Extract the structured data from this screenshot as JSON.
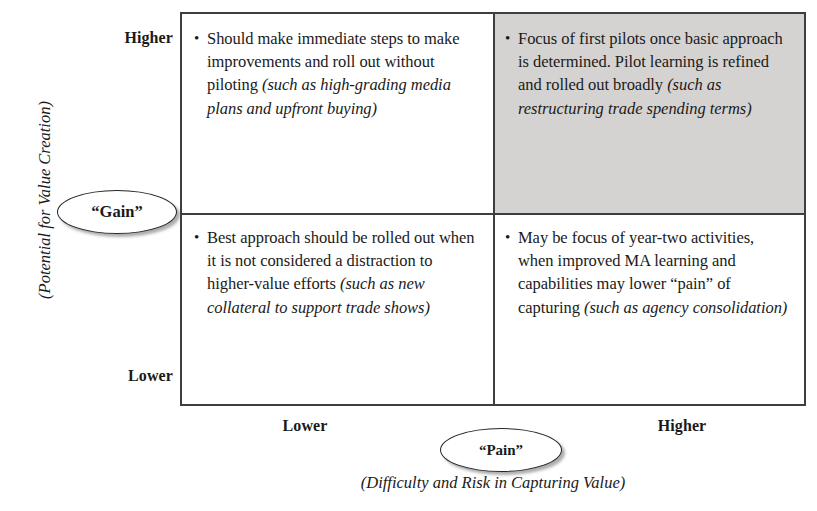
{
  "matrix": {
    "quadrants": [
      {
        "id": "top-left",
        "position": "high-gain-low-pain",
        "shaded": false,
        "bullet": "•",
        "text_plain": "Should make immediate steps to make improvements and roll out without piloting ",
        "text_italic": "(such as high-grading media plans and upfront buying)"
      },
      {
        "id": "top-right",
        "position": "high-gain-high-pain",
        "shaded": true,
        "bullet": "•",
        "text_plain": "Focus of first pilots once basic approach is determined. Pilot learning is refined and rolled out broadly ",
        "text_italic": "(such as restructuring trade spending terms)"
      },
      {
        "id": "bottom-left",
        "position": "low-gain-low-pain",
        "shaded": false,
        "bullet": "•",
        "text_plain": "Best approach should be rolled out when it is not considered a distraction to higher-value efforts ",
        "text_italic": "(such as new collateral to support trade shows)"
      },
      {
        "id": "bottom-right",
        "position": "low-gain-high-pain",
        "shaded": false,
        "bullet": "•",
        "text_plain": "May be focus of year-two activities, when improved MA learning and capabilities may lower “pain” of capturing ",
        "text_italic": "(such as agency consolidation)"
      }
    ]
  },
  "y_axis": {
    "high_label": "Higher",
    "low_label": "Lower",
    "callout": "“Gain”",
    "caption": "(Potential for Value Creation)"
  },
  "x_axis": {
    "low_label": "Lower",
    "high_label": "Higher",
    "callout": "“Pain”",
    "caption": "(Difficulty and Risk in Capturing Value)"
  },
  "colors": {
    "shaded_quadrant": "#d5d3d1",
    "border": "#3d3d42",
    "text": "#1a1a1a",
    "background": "#ffffff"
  }
}
